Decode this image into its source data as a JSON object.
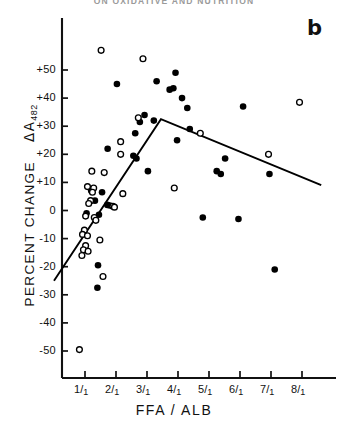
{
  "page": {
    "running_head": "ON OXIDATIVE AND NUTRITION"
  },
  "figure": {
    "panel_letter": "b"
  },
  "chart_data": {
    "type": "scatter",
    "title": "",
    "panel": "b",
    "xlabel": "FFA / ALB",
    "ylabel": "PERCENT CHANGE  ΔA₄₈₂",
    "ylabel_main": "PERCENT CHANGE",
    "ylabel_symbol": "ΔA",
    "ylabel_subscript": "482",
    "xlim": [
      0,
      9
    ],
    "ylim": [
      -57,
      60
    ],
    "grid": false,
    "legend": null,
    "y_ticks": [
      -50,
      -40,
      -30,
      -20,
      -10,
      0,
      10,
      20,
      30,
      40,
      50
    ],
    "y_tick_labels": [
      "-50",
      "-40",
      "-30",
      "-20",
      "-10",
      "0",
      "+10",
      "+20",
      "+30",
      "+40",
      "+50"
    ],
    "x_ticks": [
      1,
      2,
      3,
      4,
      5,
      6,
      7,
      8
    ],
    "x_tick_labels": [
      "1/1",
      "2/1",
      "3/1",
      "4/1",
      "5/1",
      "6/1",
      "7/1",
      "8/1"
    ],
    "x_tick_numerators": [
      "1",
      "2",
      "3",
      "4",
      "5",
      "6",
      "7",
      "8"
    ],
    "x_tick_denominators": [
      "1",
      "1",
      "1",
      "1",
      "1",
      "1",
      "1",
      "1"
    ],
    "series": [
      {
        "name": "filled-circles",
        "marker": "filled-circle",
        "color": "#000000",
        "points": [
          [
            2.03,
            45.0
          ],
          [
            3.31,
            46.0
          ],
          [
            3.92,
            49.0
          ],
          [
            3.73,
            43.0
          ],
          [
            3.85,
            43.5
          ],
          [
            4.13,
            40.0
          ],
          [
            4.3,
            36.5
          ],
          [
            2.92,
            34.0
          ],
          [
            3.22,
            32.0
          ],
          [
            2.77,
            31.5
          ],
          [
            4.38,
            29.0
          ],
          [
            2.62,
            27.5
          ],
          [
            3.97,
            25.0
          ],
          [
            1.73,
            22.0
          ],
          [
            2.56,
            19.5
          ],
          [
            2.66,
            18.5
          ],
          [
            3.03,
            14.0
          ],
          [
            5.52,
            18.5
          ],
          [
            6.1,
            37.0
          ],
          [
            5.25,
            14.0
          ],
          [
            5.38,
            13.0
          ],
          [
            6.95,
            13.0
          ],
          [
            1.2,
            7.0
          ],
          [
            1.55,
            6.5
          ],
          [
            1.32,
            3.5
          ],
          [
            1.72,
            2.0
          ],
          [
            1.8,
            1.8
          ],
          [
            1.45,
            -1.5
          ],
          [
            1.05,
            -1.0
          ],
          [
            4.8,
            -2.5
          ],
          [
            5.95,
            -3.0
          ],
          [
            1.42,
            -19.5
          ],
          [
            7.12,
            -21.0
          ],
          [
            1.4,
            -27.5
          ]
        ]
      },
      {
        "name": "open-circles",
        "marker": "open-circle",
        "color": "#000000",
        "points": [
          [
            1.52,
            57.0
          ],
          [
            2.87,
            54.0
          ],
          [
            7.92,
            38.5
          ],
          [
            2.72,
            33.0
          ],
          [
            2.15,
            24.5
          ],
          [
            2.15,
            20.0
          ],
          [
            4.72,
            27.5
          ],
          [
            6.92,
            20.0
          ],
          [
            1.22,
            14.0
          ],
          [
            1.62,
            13.5
          ],
          [
            1.08,
            8.5
          ],
          [
            1.28,
            8.0
          ],
          [
            1.24,
            6.5
          ],
          [
            2.22,
            6.0
          ],
          [
            1.18,
            3.5
          ],
          [
            1.12,
            2.5
          ],
          [
            1.9,
            1.5
          ],
          [
            1.95,
            1.2
          ],
          [
            3.88,
            8.0
          ],
          [
            1.02,
            -2.0
          ],
          [
            1.3,
            -2.5
          ],
          [
            1.35,
            -3.5
          ],
          [
            0.98,
            -7.0
          ],
          [
            0.92,
            -8.5
          ],
          [
            1.08,
            -9.0
          ],
          [
            1.48,
            -10.5
          ],
          [
            1.02,
            -12.5
          ],
          [
            0.95,
            -14.0
          ],
          [
            1.1,
            -14.5
          ],
          [
            0.9,
            -16.0
          ],
          [
            1.58,
            -23.5
          ],
          [
            0.82,
            -49.5
          ]
        ]
      }
    ],
    "fit_line": {
      "name": "piecewise-fit",
      "type": "piecewise-linear",
      "color": "#000000",
      "vertices": [
        [
          0.0,
          -25.0
        ],
        [
          3.45,
          32.5
        ],
        [
          8.62,
          9.0
        ]
      ]
    }
  }
}
